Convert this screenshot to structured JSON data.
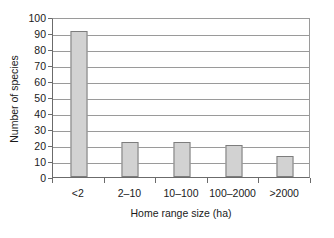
{
  "chart_data": {
    "type": "bar",
    "title": "",
    "xlabel": "Home range size (ha)",
    "ylabel": "Number of species",
    "categories": [
      "<2",
      "2–10",
      "10–100",
      "100–2000",
      ">2000"
    ],
    "values": [
      91,
      22,
      22,
      20,
      13
    ],
    "ylim": [
      0,
      100
    ],
    "ytick_labels": [
      "100",
      "90",
      "80",
      "70",
      "60",
      "50",
      "40",
      "30",
      "20",
      "10",
      "0"
    ],
    "ytick_values": [
      100,
      90,
      80,
      70,
      60,
      50,
      40,
      30,
      20,
      10,
      0
    ],
    "ytick_step": 10,
    "grid": "horizontal",
    "legend": "none",
    "bar_fill_color": "#d2d2d2",
    "bar_border_color": "#7d7d7d",
    "gridline_color": "#9a9a9a",
    "axis_color": "#6b6b6b",
    "background_color": "#ffffff"
  }
}
